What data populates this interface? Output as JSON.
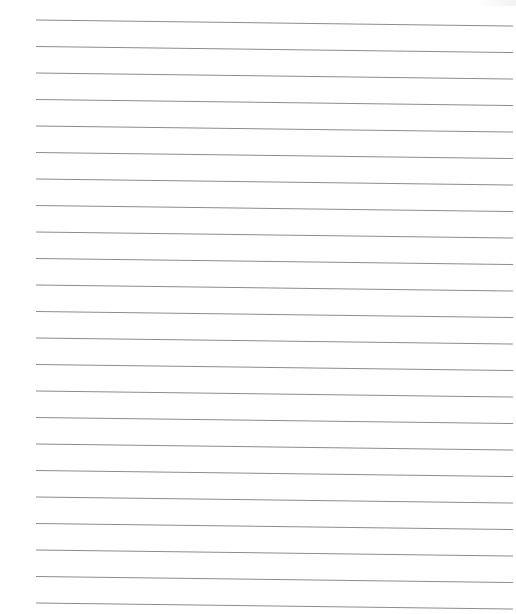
{
  "page": {
    "type": "lined-paper",
    "background_color": "#ffffff",
    "line_color": "#8c8c8c",
    "line_count": 23,
    "line_x_start": 36,
    "line_x_end": 513,
    "line_spacing": 26.5,
    "first_line_y_left": 20,
    "first_line_y_right": 26,
    "slope_drop_px": 6,
    "text": ""
  }
}
